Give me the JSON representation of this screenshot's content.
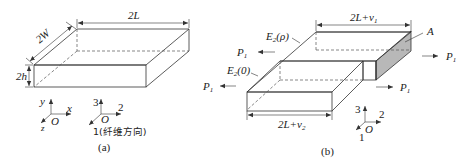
{
  "figure_a": {
    "caption": "(a)",
    "dims": {
      "length": "2L",
      "width": "2W",
      "height": "2h"
    },
    "axes_xyz": {
      "y": "y",
      "x": "x",
      "z": "z",
      "origin": "O"
    },
    "axes_123": {
      "three": "3",
      "two": "2",
      "one": "1(纤维方向)",
      "origin": "O"
    }
  },
  "figure_b": {
    "caption": "(b)",
    "dims": {
      "top_length_main": "2L+v",
      "top_length_sub": "1",
      "bottom_length_main": "2L+v",
      "bottom_length_sub": "2"
    },
    "labels": {
      "e2_rho_main": "E",
      "e2_rho_sub": "2",
      "e2_rho_arg": "(ρ)",
      "e2_zero_main": "E",
      "e2_zero_sub": "2",
      "e2_zero_arg": "(0)",
      "area": "A"
    },
    "forces": [
      {
        "id": "left_upper",
        "main": "P",
        "sub": "1",
        "direction": "left"
      },
      {
        "id": "left_lower",
        "main": "P",
        "sub": "1",
        "direction": "left"
      },
      {
        "id": "right_upper",
        "main": "P",
        "sub": "1",
        "direction": "right"
      },
      {
        "id": "right_lower",
        "main": "P",
        "sub": "1",
        "direction": "right"
      }
    ],
    "axes_123": {
      "three": "3",
      "two": "2",
      "one": "1",
      "origin": "O"
    },
    "shade_color": "#b8b8b8"
  }
}
